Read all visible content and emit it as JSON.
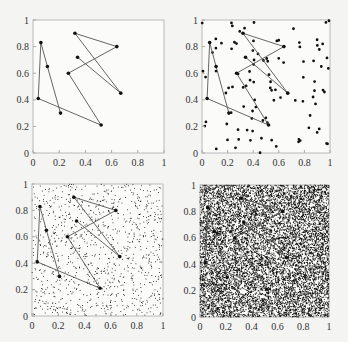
{
  "chart_data": [
    {
      "type": "scatter",
      "panel": "top-left",
      "title": "",
      "xlabel": "",
      "ylabel": "",
      "xlim": [
        0,
        1
      ],
      "ylim": [
        0,
        1
      ],
      "xticks": [
        "0",
        "0.2",
        "0.4",
        "0.6",
        "0.8",
        "1"
      ],
      "yticks": [
        "0",
        "0.2",
        "0.4",
        "0.6",
        "0.8",
        "1"
      ],
      "background_points": 0,
      "path": [
        [
          0.34,
          0.72
        ],
        [
          0.67,
          0.45
        ],
        [
          0.32,
          0.9
        ],
        [
          0.64,
          0.8
        ],
        [
          0.27,
          0.6
        ],
        [
          0.52,
          0.21
        ],
        [
          0.04,
          0.41
        ],
        [
          0.06,
          0.83
        ],
        [
          0.11,
          0.65
        ],
        [
          0.21,
          0.3
        ]
      ]
    },
    {
      "type": "scatter",
      "panel": "top-right",
      "xlim": [
        0,
        1
      ],
      "ylim": [
        0,
        1
      ],
      "xticks": [
        "0",
        "0.2",
        "0.4",
        "0.6",
        "0.8",
        "1"
      ],
      "yticks": [
        "0",
        "0.2",
        "0.4",
        "0.6",
        "0.8",
        "1"
      ],
      "background_points": 100,
      "path": [
        [
          0.34,
          0.72
        ],
        [
          0.67,
          0.45
        ],
        [
          0.32,
          0.9
        ],
        [
          0.64,
          0.8
        ],
        [
          0.27,
          0.6
        ],
        [
          0.52,
          0.21
        ],
        [
          0.04,
          0.41
        ],
        [
          0.06,
          0.83
        ],
        [
          0.11,
          0.65
        ],
        [
          0.21,
          0.3
        ]
      ]
    },
    {
      "type": "scatter",
      "panel": "bottom-left",
      "xlim": [
        0,
        1
      ],
      "ylim": [
        0,
        1
      ],
      "xticks": [
        "0",
        "0.2",
        "0.4",
        "0.6",
        "0.8",
        "1"
      ],
      "yticks": [
        "0",
        "0.2",
        "0.4",
        "0.6",
        "0.8",
        "1"
      ],
      "background_points": 1000,
      "path": [
        [
          0.34,
          0.72
        ],
        [
          0.67,
          0.45
        ],
        [
          0.32,
          0.9
        ],
        [
          0.64,
          0.8
        ],
        [
          0.27,
          0.6
        ],
        [
          0.52,
          0.21
        ],
        [
          0.04,
          0.41
        ],
        [
          0.06,
          0.83
        ],
        [
          0.11,
          0.65
        ],
        [
          0.21,
          0.3
        ]
      ]
    },
    {
      "type": "scatter",
      "panel": "bottom-right",
      "xlim": [
        0,
        1
      ],
      "ylim": [
        0,
        1
      ],
      "xticks": [
        "0",
        "0.2",
        "0.4",
        "0.6",
        "0.8",
        "1"
      ],
      "yticks": [
        "0",
        "0.2",
        "0.4",
        "0.6",
        "0.8",
        "1"
      ],
      "background_points": 10000,
      "path": [
        [
          0.34,
          0.72
        ],
        [
          0.67,
          0.45
        ],
        [
          0.32,
          0.9
        ],
        [
          0.64,
          0.8
        ],
        [
          0.27,
          0.6
        ],
        [
          0.52,
          0.21
        ],
        [
          0.04,
          0.41
        ],
        [
          0.06,
          0.83
        ],
        [
          0.11,
          0.65
        ],
        [
          0.21,
          0.3
        ]
      ]
    }
  ],
  "layout": {
    "panels": [
      {
        "left": 33,
        "top": 20,
        "width": 131,
        "height": 133
      },
      {
        "left": 202,
        "top": 20,
        "width": 128,
        "height": 133
      },
      {
        "left": 32,
        "top": 184,
        "width": 131,
        "height": 132
      },
      {
        "left": 200,
        "top": 185,
        "width": 129,
        "height": 132
      }
    ]
  },
  "colors": {
    "dot": "#111111",
    "line": "#555555",
    "frame": "#aaaaaa",
    "plot_bg": "#fbfbfa"
  }
}
